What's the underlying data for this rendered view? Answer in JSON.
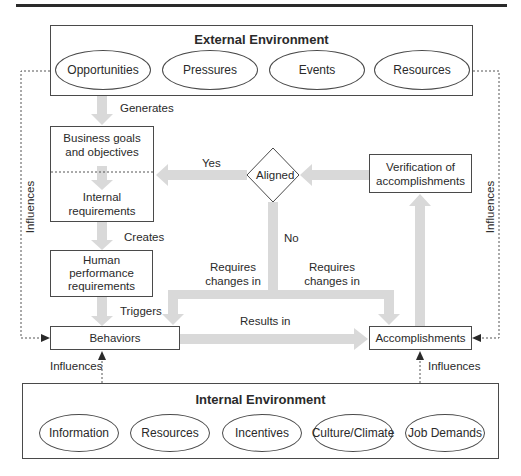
{
  "external_environment": {
    "title": "External Environment",
    "items": [
      "Opportunities",
      "Pressures",
      "Events",
      "Resources"
    ]
  },
  "internal_environment": {
    "title": "Internal Environment",
    "items": [
      "Information",
      "Resources",
      "Incentives",
      "Culture/Climate",
      "Job Demands"
    ]
  },
  "nodes": {
    "business_goals": "Business goals and objectives",
    "business_goals_l1": "Business goals",
    "business_goals_l2": "and objectives",
    "internal_req_l1": "Internal",
    "internal_req_l2": "requirements",
    "human_perf_l1": "Human",
    "human_perf_l2": "performance",
    "human_perf_l3": "requirements",
    "behaviors": "Behaviors",
    "accomplishments": "Accomplishments",
    "verification_l1": "Verification of",
    "verification_l2": "accomplishments",
    "decision": "Aligned"
  },
  "edge_labels": {
    "generates": "Generates",
    "creates": "Creates",
    "triggers": "Triggers",
    "yes": "Yes",
    "no": "No",
    "requires_left_l1": "Requires",
    "requires_left_l2": "changes in",
    "requires_right_l1": "Requires",
    "requires_right_l2": "changes in",
    "results_in": "Results in",
    "influences_left": "Influences",
    "influences_right": "Influences",
    "influences_behaviors": "Influences",
    "influences_accomplishments": "Influences"
  },
  "colors": {
    "arrow_fill": "#d9d9d9",
    "line": "#4a4a4a",
    "text": "#2a2a2a"
  }
}
